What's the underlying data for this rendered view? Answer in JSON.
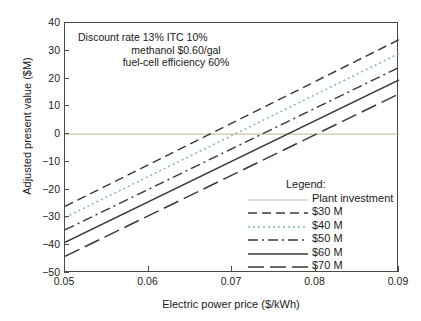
{
  "chart_data": {
    "type": "line",
    "title": "",
    "xlabel": "Electric power price ($/kWh)",
    "ylabel": "Adjusted present value ($M)",
    "xlim": [
      0.05,
      0.09
    ],
    "ylim": [
      -50,
      40
    ],
    "xticks": [
      "0.05",
      "0.06",
      "0.07",
      "0.08",
      "0.09"
    ],
    "xtick_values": [
      0.05,
      0.06,
      0.07,
      0.08,
      0.09
    ],
    "yticks": [
      "40",
      "30",
      "20",
      "10",
      "0",
      "−10",
      "−20",
      "−30",
      "−40",
      "−50"
    ],
    "ytick_values": [
      40,
      30,
      20,
      10,
      0,
      -10,
      -20,
      -30,
      -40,
      -50
    ],
    "grid": false,
    "legend_position": "inside-lower-right",
    "x": [
      0.05,
      0.09
    ],
    "series": [
      {
        "name": "Plant investment",
        "values": [
          0,
          0
        ],
        "style": "solid",
        "color": "#b3ae94",
        "width": 0.9,
        "note": "horizontal reference line at zero"
      },
      {
        "name": "$30 M",
        "values": [
          -26,
          34
        ],
        "style": "dashed",
        "color": "#3a3a3a",
        "width": 1.5,
        "zero_crossing": 0.0673
      },
      {
        "name": "$40 M",
        "values": [
          -30,
          29
        ],
        "style": "dotted",
        "color": "#7fbf9a",
        "width": 1.5,
        "zero_crossing": 0.0703
      },
      {
        "name": "$50 M",
        "values": [
          -34.5,
          24
        ],
        "style": "dashdot",
        "color": "#3a3a3a",
        "width": 1.5,
        "zero_crossing": 0.0736
      },
      {
        "name": "$60 M",
        "values": [
          -39,
          19.5
        ],
        "style": "solid",
        "color": "#3a3a3a",
        "width": 1.5,
        "zero_crossing": 0.0767
      },
      {
        "name": "$70 M",
        "values": [
          -44,
          14.5
        ],
        "style": "longdash",
        "color": "#3a3a3a",
        "width": 1.5,
        "zero_crossing": 0.0801
      }
    ]
  },
  "annotation": {
    "line1": "Discount rate 13% ITC 10%",
    "line2": "methanol $0.60/gal",
    "line3": "fuel-cell efficiency 60%"
  },
  "legend": {
    "title": "Legend:",
    "entries": [
      {
        "label": "Plant investment"
      },
      {
        "label": "$30 M"
      },
      {
        "label": "$40 M"
      },
      {
        "label": "$50 M"
      },
      {
        "label": "$60 M"
      },
      {
        "label": "$70 M"
      }
    ]
  }
}
